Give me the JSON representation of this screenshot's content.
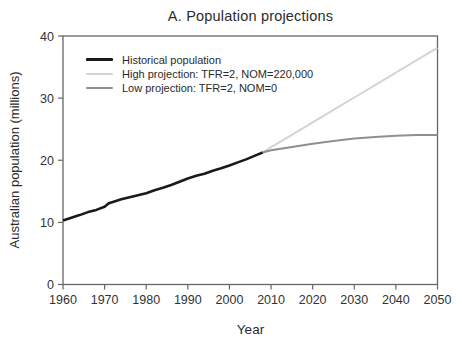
{
  "figure": {
    "title": "A. Population projections"
  },
  "chart_data": {
    "type": "line",
    "title": "A. Population projections",
    "xlabel": "Year",
    "ylabel": "Australian population (millions)",
    "xlim": [
      1960,
      2050
    ],
    "ylim": [
      0,
      40
    ],
    "x_ticks": [
      1960,
      1970,
      1980,
      1990,
      2000,
      2010,
      2020,
      2030,
      2040,
      2050
    ],
    "y_ticks": [
      0,
      10,
      20,
      30,
      40
    ],
    "grid": false,
    "legend_position": "upper-left-inside",
    "axis_color": "#666666",
    "tick_label_color": "#333333",
    "series": [
      {
        "name": "Historical population",
        "color": "#1a1a1a",
        "width": 2.6,
        "x": [
          1960,
          1962,
          1964,
          1966,
          1968,
          1970,
          1971,
          1972,
          1974,
          1976,
          1978,
          1980,
          1982,
          1984,
          1986,
          1988,
          1990,
          1992,
          1994,
          1996,
          1998,
          2000,
          2002,
          2004,
          2006,
          2008
        ],
        "y": [
          10.28,
          10.74,
          11.17,
          11.65,
          12.01,
          12.51,
          13.07,
          13.3,
          13.72,
          14.03,
          14.36,
          14.69,
          15.18,
          15.58,
          16.02,
          16.53,
          17.07,
          17.49,
          17.84,
          18.31,
          18.71,
          19.15,
          19.65,
          20.13,
          20.7,
          21.25
        ]
      },
      {
        "name": "High projection: TFR=2, NOM=220,000",
        "color": "#d4d4d4",
        "width": 2,
        "x": [
          2008,
          2010,
          2015,
          2020,
          2025,
          2030,
          2035,
          2040,
          2045,
          2050
        ],
        "y": [
          21.25,
          22.1,
          24.1,
          26.1,
          28.1,
          30.1,
          32.1,
          34.1,
          36.1,
          38.1
        ]
      },
      {
        "name": "Low projection: TFR=2, NOM=0",
        "color": "#8f8f8f",
        "width": 2,
        "x": [
          2008,
          2010,
          2015,
          2020,
          2025,
          2030,
          2035,
          2040,
          2045,
          2050
        ],
        "y": [
          21.25,
          21.6,
          22.15,
          22.65,
          23.1,
          23.5,
          23.75,
          23.95,
          24.05,
          24.05
        ]
      }
    ]
  }
}
